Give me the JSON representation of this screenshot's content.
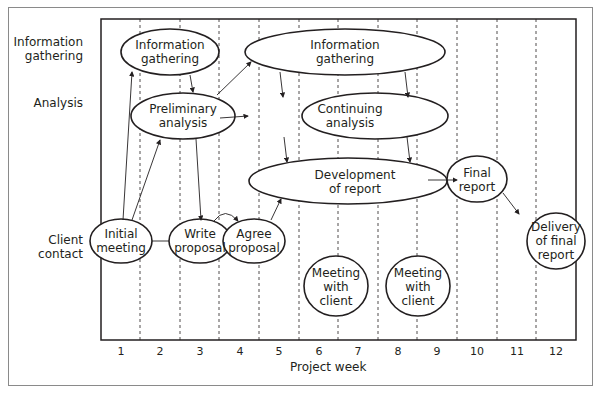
{
  "rows": [
    {
      "label": "Information\ngathering"
    },
    {
      "label": "Analysis"
    },
    {
      "label": "Client\ncontact"
    }
  ],
  "x_axis": {
    "label": "Project week",
    "ticks": [
      "1",
      "2",
      "3",
      "4",
      "5",
      "6",
      "7",
      "8",
      "9",
      "10",
      "11",
      "12"
    ]
  },
  "nodes": {
    "info1": "Information gathering",
    "info2": "Information gathering",
    "prelim": "Preliminary analysis",
    "cont": "Continuing analysis",
    "dev": "Development of report",
    "final": "Final report",
    "initial": "Initial meeting",
    "write": "Write proposal",
    "agree": "Agree proposal",
    "meet1": "Meeting with client",
    "meet2": "Meeting with client",
    "delivery": "Delivery of final report"
  },
  "colors": {
    "line": "#231f20",
    "frame": "#8a8a8a"
  }
}
